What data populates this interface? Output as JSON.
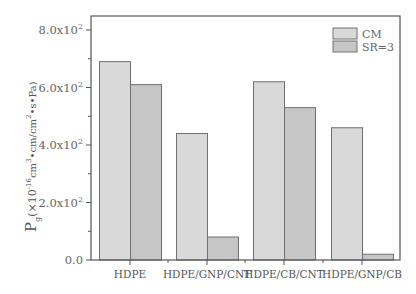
{
  "chart_data": {
    "type": "bar",
    "title": "",
    "xlabel": "",
    "ylabel": "Pg(×10^-16 cm3•cm/cm2•s•Pa)",
    "ylabel_parts": {
      "main": "P",
      "sub": "g",
      "paren_open": "(×10",
      "exp": "-16",
      "unit1": "cm",
      "unit1_exp": "3",
      "mid": "•cm/cm",
      "unit2_exp": "2",
      "tail": "•s•Pa)"
    },
    "categories": [
      "HDPE",
      "HDPE/GNP/CNT",
      "HDPE/CB/CNT",
      "HDPE/GNP/CB"
    ],
    "series": [
      {
        "name": "CM",
        "values": [
          690,
          440,
          620,
          460
        ],
        "color": "#d9d9d9"
      },
      {
        "name": "SR=3",
        "values": [
          610,
          80,
          530,
          20
        ],
        "color": "#c6c6c6"
      }
    ],
    "ylim": [
      0,
      850
    ],
    "yticks": [
      {
        "value": 0,
        "label": "0.0"
      },
      {
        "value": 200,
        "label": "2.0x10",
        "exp": "2"
      },
      {
        "value": 400,
        "label": "4.0x10",
        "exp": "2"
      },
      {
        "value": 600,
        "label": "6.0x10",
        "exp": "2"
      },
      {
        "value": 800,
        "label": "8.0x10",
        "exp": "2"
      }
    ],
    "grid": false,
    "legend_position": "upper right"
  },
  "colors": {
    "axis": "#555555",
    "bar_edge": "#707070"
  }
}
